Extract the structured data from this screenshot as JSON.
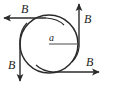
{
  "figure": {
    "caption": "",
    "colors": {
      "stroke": "#2b2b2b",
      "background": "#ffffff",
      "label": "#1c1c1c"
    },
    "circle": {
      "name": "loop-circle",
      "center_x": 49,
      "center_y": 44,
      "radius": 29
    },
    "radius_indicator": {
      "label": "a",
      "line_from_x": 49,
      "line_from_y": 44,
      "line_to_x": 79,
      "line_to_y": 44
    },
    "field_arrows": [
      {
        "id": "arrow-top-left",
        "label": "B",
        "direction": "left",
        "from_x": 46,
        "from_y": 18,
        "to_x": 4,
        "to_y": 18
      },
      {
        "id": "arrow-right-up",
        "label": "B",
        "direction": "up",
        "from_x": 79,
        "from_y": 47,
        "to_x": 79,
        "to_y": 4
      },
      {
        "id": "arrow-bottom-left-down",
        "label": "B",
        "direction": "down",
        "from_x": 20,
        "from_y": 40,
        "to_x": 20,
        "to_y": 82
      },
      {
        "id": "arrow-bottom-right",
        "label": "B",
        "direction": "right",
        "from_x": 54,
        "from_y": 72,
        "to_x": 100,
        "to_y": 72
      }
    ]
  }
}
